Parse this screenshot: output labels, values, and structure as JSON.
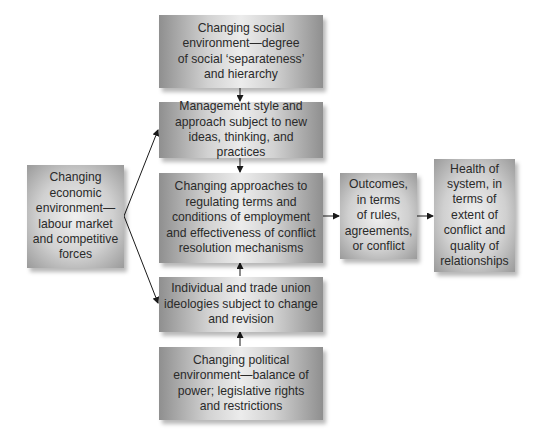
{
  "diagram": {
    "nodes": {
      "social": {
        "label": "Changing social\nenvironment—degree\nof social ‘separateness’\nand hierarchy"
      },
      "management": {
        "label": "Management style and\napproach subject to new\nideas, thinking, and practices"
      },
      "approaches": {
        "label": "Changing approaches to\nregulating terms and\nconditions of employment\nand effectiveness of conflict\nresolution mechanisms"
      },
      "ideologies": {
        "label": "Individual and trade union\nideologies subject to change\nand revision"
      },
      "political": {
        "label": "Changing political\nenvironment—balance of\npower; legislative rights\nand restrictions"
      },
      "economic": {
        "label": "Changing\neconomic\nenvironment—\nlabour market\nand competitive\nforces"
      },
      "outcomes": {
        "label": "Outcomes,\nin terms\nof rules,\nagreements,\nor conflict"
      },
      "health": {
        "label": "Health of\nsystem, in\nterms of\nextent of\nconflict and\nquality of\nrelationships"
      }
    },
    "edges": [
      {
        "from": "social",
        "to": "management"
      },
      {
        "from": "management",
        "to": "approaches"
      },
      {
        "from": "ideologies",
        "to": "approaches"
      },
      {
        "from": "political",
        "to": "ideologies"
      },
      {
        "from": "economic",
        "to": "management"
      },
      {
        "from": "economic",
        "to": "ideologies"
      },
      {
        "from": "approaches",
        "to": "outcomes"
      },
      {
        "from": "outcomes",
        "to": "health"
      }
    ],
    "colors": {
      "box_edge": "#8f8f8f",
      "box_center": "#ececec",
      "arrow": "#1a1a1a",
      "text": "#2a2a2a"
    }
  }
}
